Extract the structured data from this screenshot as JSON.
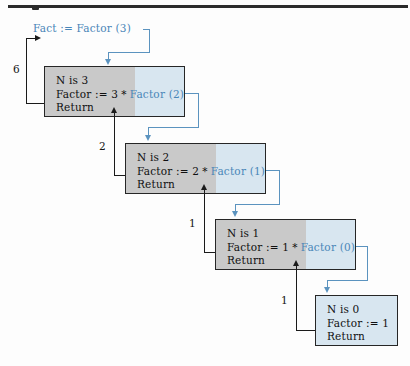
{
  "figure": {
    "type": "recursion-trace-diagram",
    "colors": {
      "call_arrow": "#5b93bf",
      "return_arrow": "#1a1a1a",
      "frame_border": "#262626",
      "frame_fill_executed": "#c9c9c9",
      "frame_fill_pending": "#d8e6f0",
      "call_text": "#4a86b8",
      "body_text": "#101010",
      "page_rule": "#2b2b2b"
    }
  },
  "initial_call": {
    "label": "Fact := Factor (3)"
  },
  "frames": [
    {
      "id": "frame-n3",
      "line1": "N is 3",
      "line2_prefix": "Factor := 3",
      "line2_operator": "*",
      "line2_call": "Factor (2)",
      "line3": "Return"
    },
    {
      "id": "frame-n2",
      "line1": "N is 2",
      "line2_prefix": "Factor := 2",
      "line2_operator": "*",
      "line2_call": "Factor (1)",
      "line3": "Return"
    },
    {
      "id": "frame-n1",
      "line1": "N is 1",
      "line2_prefix": "Factor := 1",
      "line2_operator": "*",
      "line2_call": "Factor (0)",
      "line3": "Return"
    },
    {
      "id": "frame-n0",
      "line1": "N is 0",
      "line2_prefix": "Factor := 1",
      "line2_operator": "",
      "line2_call": "",
      "line3": "Return"
    }
  ],
  "return_values": [
    {
      "id": "return-to-caller",
      "label": "6"
    },
    {
      "id": "return-n2-to-n3",
      "label": "2"
    },
    {
      "id": "return-n1-to-n2",
      "label": "1"
    },
    {
      "id": "return-n0-to-n1",
      "label": "1"
    }
  ]
}
